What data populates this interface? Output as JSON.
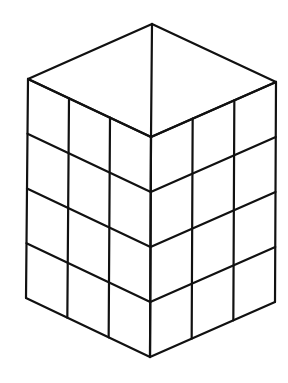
{
  "diagram": {
    "type": "isometric-block-prism",
    "left_face_columns": 3,
    "right_face_columns": 3,
    "rows": 4,
    "stroke_color": "#111111",
    "background": "#ffffff",
    "vertices": {
      "top": [
        152,
        24
      ],
      "left_top": [
        28,
        79
      ],
      "right_top": [
        276,
        82
      ],
      "front_top": [
        151,
        137
      ],
      "left_bottom": [
        26,
        298
      ],
      "right_bottom": [
        275,
        302
      ],
      "front_bottom": [
        150,
        357
      ]
    }
  }
}
